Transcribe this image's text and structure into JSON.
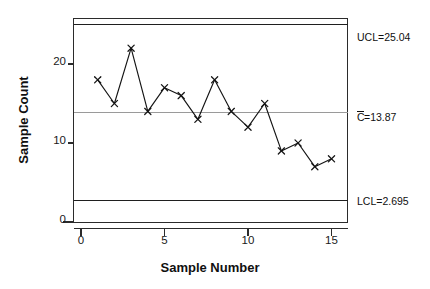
{
  "chart_data": {
    "type": "line",
    "title": "",
    "subtitle": "",
    "xlabel": "Sample Number",
    "ylabel": "Sample Count",
    "x": [
      1,
      2,
      3,
      4,
      5,
      6,
      7,
      8,
      9,
      10,
      11,
      12,
      13,
      14,
      15
    ],
    "values": [
      18,
      15,
      22,
      14,
      17,
      16,
      13,
      18,
      14,
      12,
      15,
      9,
      10,
      7,
      8
    ],
    "series": [
      {
        "name": "Sample Count",
        "values": [
          18,
          15,
          22,
          14,
          17,
          16,
          13,
          18,
          14,
          12,
          15,
          9,
          10,
          7,
          8
        ]
      }
    ],
    "xlim": [
      0,
      15.8
    ],
    "ylim": [
      0,
      27.2
    ],
    "xticks": [
      0,
      5,
      10,
      15
    ],
    "xtick_labels": [
      "0",
      "5",
      "10",
      "15"
    ],
    "yticks": [
      0,
      10,
      20
    ],
    "ytick_labels": [
      "0",
      "10",
      "20"
    ],
    "grid": false,
    "legend_position": "none",
    "marker": "x",
    "reference_lines": [
      {
        "id": "ucl",
        "label": "UCL=25.04",
        "label_prefix": "UCL=",
        "label_value": "25.04",
        "value": 25.04,
        "color": "#1f1f1f",
        "style": "solid",
        "overbar": false
      },
      {
        "id": "center",
        "label": "C̄=13.87",
        "label_prefix": "C=",
        "label_value": "13.87",
        "value": 13.87,
        "color": "#9a9a9a",
        "style": "solid",
        "overbar": true
      },
      {
        "id": "lcl",
        "label": "LCL=2.695",
        "label_prefix": "LCL=",
        "label_value": "2.695",
        "value": 2.695,
        "color": "#1f1f1f",
        "style": "solid",
        "overbar": false
      }
    ]
  },
  "labels": {
    "ucl_text": "UCL=25.04",
    "center_c": "C",
    "center_text": "=13.87",
    "lcl_text": "LCL=2.695",
    "y_axis_title": "Sample Count",
    "x_axis_title": "Sample Number",
    "ytick_0": "0",
    "ytick_10": "10",
    "ytick_20": "20",
    "xtick_0": "0",
    "xtick_5": "5",
    "xtick_10": "10",
    "xtick_15": "15"
  }
}
